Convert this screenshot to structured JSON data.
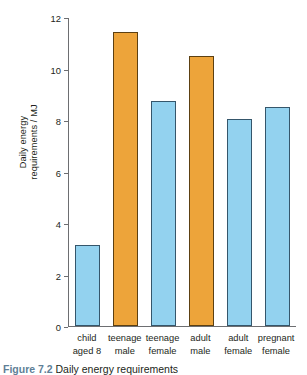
{
  "chart_data": {
    "type": "bar",
    "title": "",
    "xlabel": "",
    "ylabel": "Daily energy requirements / MJ",
    "ylabel_line1": "Daily energy",
    "ylabel_line2": "requirements / MJ",
    "categories": [
      "child aged 8",
      "teenage male",
      "teenage female",
      "adult male",
      "adult female",
      "pregnant female"
    ],
    "category_lines": [
      {
        "line1": "child",
        "line2": "aged 8"
      },
      {
        "line1": "teenage",
        "line2": "male"
      },
      {
        "line1": "teenage",
        "line2": "female"
      },
      {
        "line1": "adult",
        "line2": "male"
      },
      {
        "line1": "adult",
        "line2": "female"
      },
      {
        "line1": "pregnant",
        "line2": "female"
      }
    ],
    "values": [
      3.15,
      11.4,
      8.75,
      10.5,
      8.05,
      8.5
    ],
    "bar_colors": [
      "#93d2ef",
      "#eda43a",
      "#93d2ef",
      "#eda43a",
      "#93d2ef",
      "#93d2ef"
    ],
    "ylim": [
      0,
      12
    ],
    "yticks": [
      0,
      2,
      4,
      6,
      8,
      10,
      12
    ],
    "ytick_labels": [
      "0",
      "2",
      "4",
      "6",
      "8",
      "10",
      "12"
    ],
    "grid": false,
    "legend": "none",
    "units": "MJ"
  },
  "figure": {
    "caption_label": "Figure 7.2",
    "caption_text": " Daily energy requirements"
  },
  "colors": {
    "blue_bar": "#93d2ef",
    "orange_bar": "#eda43a",
    "axis": "#6d6e71",
    "text": "#231f20",
    "caption_label": "#5f7f97"
  }
}
